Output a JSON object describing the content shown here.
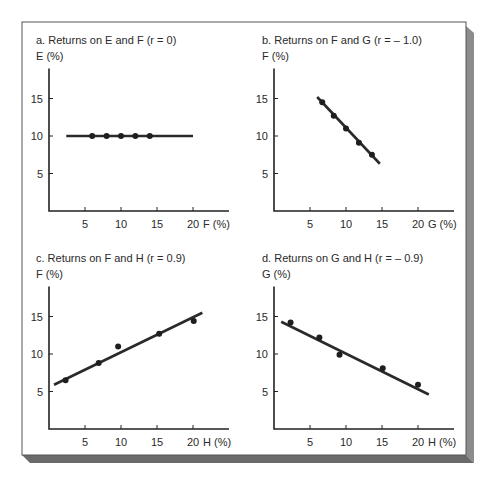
{
  "frame": {
    "background": "#ffffff",
    "border_color": "#555555",
    "shadow_bottom": "#6a6a6a",
    "shadow_right": "#8c8c8c"
  },
  "chart_data": [
    {
      "panel": "a",
      "type": "scatter",
      "title": "a. Returns on E and F (r = 0)",
      "ylabel": "E (%)",
      "xlabel": "F (%)",
      "xticks": [
        5,
        10,
        15,
        20
      ],
      "yticks": [
        5,
        10,
        15
      ],
      "xlim": [
        0,
        25
      ],
      "ylim": [
        0,
        19
      ],
      "grid": false,
      "correlation": 0,
      "points": [
        [
          6,
          10
        ],
        [
          8,
          10
        ],
        [
          10,
          10
        ],
        [
          12,
          10
        ],
        [
          14,
          10
        ]
      ],
      "fit_line": [
        [
          2.4,
          10
        ],
        [
          20,
          10
        ]
      ]
    },
    {
      "panel": "b",
      "type": "scatter",
      "title": "b. Returns on F and G (r = – 1.0)",
      "ylabel": "F (%)",
      "xlabel": "G (%)",
      "xticks": [
        5,
        10,
        15,
        20
      ],
      "yticks": [
        5,
        10,
        15
      ],
      "xlim": [
        0,
        25
      ],
      "ylim": [
        0,
        19
      ],
      "grid": false,
      "correlation": -1.0,
      "points": [
        [
          6.7,
          14.5
        ],
        [
          8.3,
          12.7
        ],
        [
          10,
          11
        ],
        [
          11.8,
          9.1
        ],
        [
          13.6,
          7.5
        ]
      ],
      "fit_line": [
        [
          6,
          15.2
        ],
        [
          14.7,
          6.3
        ]
      ]
    },
    {
      "panel": "c",
      "type": "scatter",
      "title": "c. Returns on F and H (r = 0.9)",
      "ylabel": "F (%)",
      "xlabel": "H (%)",
      "xticks": [
        5,
        10,
        15,
        20
      ],
      "yticks": [
        5,
        10,
        15
      ],
      "xlim": [
        0,
        25
      ],
      "ylim": [
        0,
        19
      ],
      "grid": false,
      "correlation": 0.9,
      "points": [
        [
          2.3,
          6.5
        ],
        [
          6.9,
          8.8
        ],
        [
          9.6,
          11
        ],
        [
          15.3,
          12.7
        ],
        [
          20.1,
          14.4
        ]
      ],
      "fit_line": [
        [
          0.7,
          5.9
        ],
        [
          21.3,
          15.5
        ]
      ]
    },
    {
      "panel": "d",
      "type": "scatter",
      "title": "d. Returns on G and H (r = – 0.9)",
      "ylabel": "G (%)",
      "xlabel": "H (%)",
      "xticks": [
        5,
        10,
        15,
        20
      ],
      "yticks": [
        5,
        10,
        15
      ],
      "xlim": [
        0,
        25
      ],
      "ylim": [
        0,
        19
      ],
      "grid": false,
      "correlation": -0.9,
      "points": [
        [
          2.3,
          14.2
        ],
        [
          6.3,
          12.2
        ],
        [
          9.1,
          9.9
        ],
        [
          15.1,
          8.1
        ],
        [
          20,
          5.9
        ]
      ],
      "fit_line": [
        [
          1,
          14.3
        ],
        [
          21.5,
          4.6
        ]
      ]
    }
  ]
}
